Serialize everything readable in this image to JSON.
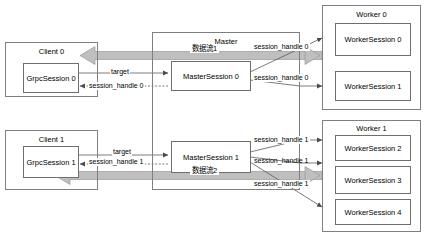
{
  "diagram": {
    "colors": {
      "box_border": "#7f7f7f",
      "inner_border": "#6e6e6e",
      "thin_arrow": "#5a5a5a",
      "thick_arrow_fill": "#bfbfbf",
      "thick_arrow_stroke": "#9a9a9a",
      "text": "#000000",
      "background": "#ffffff"
    },
    "clients": [
      {
        "id": "client-0",
        "label": "Client 0",
        "session": {
          "id": "grpcsession-0",
          "label": "GrpcSession 0"
        }
      },
      {
        "id": "client-1",
        "label": "Client 1",
        "session": {
          "id": "grpcsession-1",
          "label": "GrpcSession 1"
        }
      }
    ],
    "master": {
      "id": "master",
      "label": "Master",
      "sessions": [
        {
          "id": "mastersession-0",
          "label": "MasterSession 0"
        },
        {
          "id": "mastersession-1",
          "label": "MasterSession 1"
        }
      ]
    },
    "workers": [
      {
        "id": "worker-0",
        "label": "Worker 0",
        "sessions": [
          {
            "id": "workersession-0",
            "label": "WorkerSession 0"
          },
          {
            "id": "workersession-1",
            "label": "WorkerSession 1"
          }
        ]
      },
      {
        "id": "worker-1",
        "label": "Worker 1",
        "sessions": [
          {
            "id": "workersession-2",
            "label": "WorkerSession 2"
          },
          {
            "id": "workersession-3",
            "label": "WorkerSession 3"
          },
          {
            "id": "workersession-4",
            "label": "WorkerSession 4"
          }
        ]
      }
    ],
    "edge_labels": {
      "target_0": "target",
      "target_1": "target",
      "session_handle_client_0": "session_handle 0",
      "session_handle_client_1": "session_handle 1",
      "session_handle_worker_0a": "session_handle 0",
      "session_handle_worker_0b": "session_handle 0",
      "session_handle_worker_1a": "session_handle 1",
      "session_handle_worker_1b": "session_handle 1",
      "session_handle_worker_1c": "session_handle 1"
    },
    "data_flows": [
      {
        "id": "dataflow-1",
        "label": "数据流1",
        "direction": "right"
      },
      {
        "id": "dataflow-2",
        "label": "数据流2",
        "direction": "left"
      }
    ]
  }
}
